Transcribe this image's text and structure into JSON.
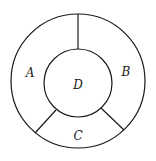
{
  "diagram": {
    "type": "annular-regions",
    "outer_circle": {
      "cx": 78,
      "cy": 81,
      "r": 67
    },
    "inner_circle": {
      "cx": 78,
      "cy": 83,
      "r": 34
    },
    "dividers": [
      {
        "name": "divider-top",
        "x1": 78,
        "y1": 14,
        "x2": 78,
        "y2": 49
      },
      {
        "name": "divider-lower-left",
        "x1": 56,
        "y1": 110,
        "x2": 35,
        "y2": 133
      },
      {
        "name": "divider-lower-right",
        "x1": 101,
        "y1": 108,
        "x2": 124,
        "y2": 130
      }
    ],
    "regions": [
      {
        "label": "A",
        "x": 30,
        "y": 77
      },
      {
        "label": "B",
        "x": 126,
        "y": 76
      },
      {
        "label": "C",
        "x": 78,
        "y": 140
      },
      {
        "label": "D",
        "x": 78,
        "y": 89
      }
    ]
  }
}
